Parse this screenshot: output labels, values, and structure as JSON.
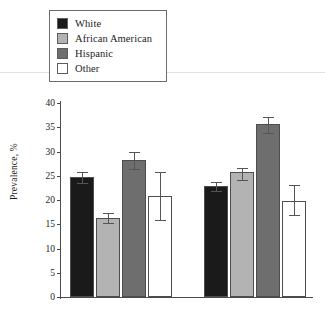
{
  "chart_data": {
    "type": "bar",
    "title": "",
    "xlabel": "",
    "ylabel": "Prevalence, %",
    "ylim": [
      0,
      40
    ],
    "yticks": [
      0,
      5,
      10,
      15,
      20,
      25,
      30,
      35,
      40
    ],
    "ytick_labels": [
      "0",
      "5",
      "10",
      "15",
      "20",
      "25",
      "30",
      "35",
      "40"
    ],
    "grid": false,
    "legend_position": "top-left",
    "categories": [
      "Men",
      "Women"
    ],
    "series": [
      {
        "name": "White",
        "color": "#1a1a1a",
        "values": [
          24.7,
          22.8
        ],
        "err_low": [
          23.5,
          21.9
        ],
        "err_high": [
          25.8,
          23.8
        ]
      },
      {
        "name": "African American",
        "color": "#b3b3b3",
        "values": [
          16.3,
          25.7
        ],
        "err_low": [
          15.2,
          24.2
        ],
        "err_high": [
          17.4,
          26.7
        ]
      },
      {
        "name": "Hispanic",
        "color": "#6e6e6e",
        "values": [
          28.2,
          35.6
        ],
        "err_low": [
          26.4,
          33.9
        ],
        "err_high": [
          30.0,
          37.1
        ]
      },
      {
        "name": "Other",
        "color": "#ffffff",
        "values": [
          20.9,
          19.8
        ],
        "err_low": [
          15.8,
          16.9
        ],
        "err_high": [
          25.8,
          23.0
        ]
      }
    ]
  }
}
